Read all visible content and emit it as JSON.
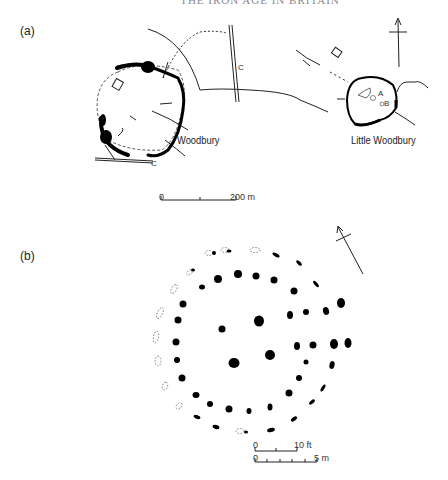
{
  "header": {
    "text": "THE IRON AGE IN BRITAIN"
  },
  "panel_a": {
    "label": "(a)",
    "sites": [
      {
        "name": "Woodbury"
      },
      {
        "name": "Little Woodbury"
      }
    ],
    "markers": {
      "c1": "C",
      "c2": "C",
      "a": "A",
      "b": "B"
    },
    "scale": {
      "start": "0",
      "end": "200 m"
    }
  },
  "panel_b": {
    "label": "(b)",
    "scale_ft": {
      "start": "0",
      "end": "10 ft"
    },
    "scale_m": {
      "start": "0",
      "end": "5 m"
    }
  },
  "colors": {
    "ink": "#111111",
    "background": "#ffffff",
    "dashed": "#777777"
  }
}
